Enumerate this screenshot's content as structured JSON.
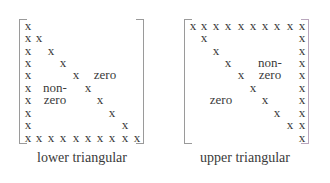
{
  "diagram": {
    "lower": {
      "caption": "lower triangular",
      "entry_symbol": "x",
      "size": 10,
      "region_labels": {
        "zero_top": "zero",
        "nonzero_line1": "non-",
        "nonzero_line2": "zero"
      }
    },
    "upper": {
      "caption": "upper triangular",
      "entry_symbol": "x",
      "size": 10,
      "region_labels": {
        "nonzero_line1": "non-",
        "nonzero_line2": "zero",
        "zero_bottom": "zero"
      }
    },
    "colors": {
      "text": "#3a3a3a",
      "bracket": "#9a9a9a"
    }
  }
}
